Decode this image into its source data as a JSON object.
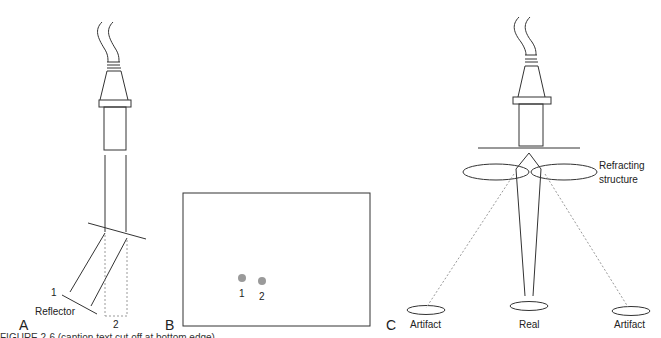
{
  "figure": {
    "panels": [
      {
        "id": "A",
        "label": "A",
        "annotations": {
          "reflector": "Reflector",
          "path1": "1",
          "path2": "2"
        }
      },
      {
        "id": "B",
        "label": "B",
        "annotations": {
          "dot1": "1",
          "dot2": "2"
        },
        "dot_color": "#9a9a9a"
      },
      {
        "id": "C",
        "label": "C",
        "annotations": {
          "refracting_line1": "Refracting",
          "refracting_line2": "structure",
          "artifact_left": "Artifact",
          "real": "Real",
          "artifact_right": "Artifact"
        }
      }
    ],
    "caption_partial": "FIGURE 2-6 (caption text cut off at bottom edge)",
    "colors": {
      "line": "#333333",
      "dashed": "#9a9a9a",
      "dot": "#9a9a9a"
    }
  }
}
